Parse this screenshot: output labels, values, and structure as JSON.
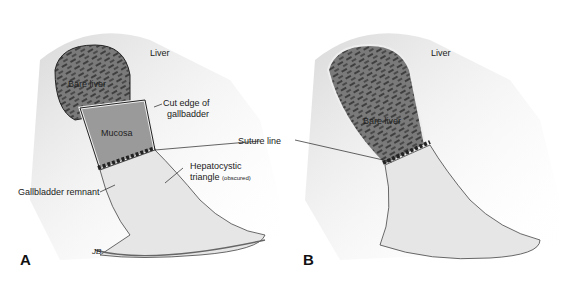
{
  "figure": {
    "panels": [
      {
        "id": "A",
        "letter": "A",
        "labels": {
          "liver": "Liver",
          "bare_liver": "Bare liver",
          "cut_edge": "Cut edge of",
          "cut_edge_2": "gallbadder",
          "mucosa": "Mucosa",
          "suture_line": "Suture line",
          "hepatocystic": "Hepatocystic",
          "triangle": "triangle",
          "obscured": "(obscured)",
          "gb_remnant": "Gallbladder remnant"
        },
        "signature": "JB"
      },
      {
        "id": "B",
        "letter": "B",
        "labels": {
          "liver": "Liver",
          "bare_liver": "Bare liver"
        }
      }
    ],
    "colors": {
      "ink": "#222222",
      "liver_bed": "#5a5a5a",
      "shading": "#bdbdbd",
      "background": "#ffffff"
    }
  }
}
